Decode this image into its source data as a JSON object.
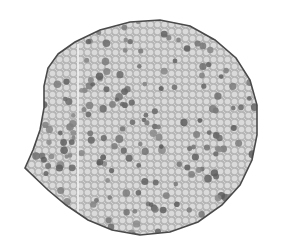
{
  "image": {
    "subject": "Micrograph of a plant stem cross-section with scattered vascular bundles",
    "background_color": "#ffffff",
    "tissue_color": "#b8b8b8",
    "cell_color": "#dcdcdc",
    "bundle_color": "#6e6e6e",
    "outline_color": "#4a4a4a",
    "scratch_line_color": "#f4f4f4",
    "outline_points": [
      [
        58,
        54
      ],
      [
        75,
        42
      ],
      [
        100,
        30
      ],
      [
        130,
        22
      ],
      [
        160,
        20
      ],
      [
        190,
        26
      ],
      [
        215,
        40
      ],
      [
        236,
        58
      ],
      [
        250,
        80
      ],
      [
        257,
        105
      ],
      [
        257,
        135
      ],
      [
        252,
        160
      ],
      [
        240,
        185
      ],
      [
        222,
        205
      ],
      [
        198,
        222
      ],
      [
        170,
        232
      ],
      [
        140,
        235
      ],
      [
        112,
        230
      ],
      [
        88,
        220
      ],
      [
        66,
        205
      ],
      [
        48,
        190
      ],
      [
        25,
        168
      ],
      [
        33,
        150
      ],
      [
        40,
        130
      ],
      [
        44,
        108
      ],
      [
        44,
        86
      ],
      [
        48,
        68
      ]
    ],
    "scratch_line": {
      "x": 78,
      "y1": 44,
      "y2": 218
    }
  }
}
